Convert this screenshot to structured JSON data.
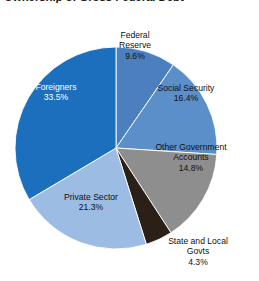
{
  "chart_title": "Ownership of Gross Federal Debt",
  "chart_data": {
    "type": "pie",
    "title": "Ownership of Gross Federal Debt",
    "xlabel": "",
    "ylabel": "",
    "legend_position": "none",
    "grid": false,
    "labels_inside": true,
    "total": 99.9,
    "unit": "%",
    "categories": [
      "Federal Reserve",
      "Social Security",
      "Other Government Accounts",
      "State and Local Govts",
      "Private Sector",
      "Foreigners"
    ],
    "values": [
      9.6,
      16.4,
      14.8,
      4.3,
      21.3,
      33.5
    ],
    "colors": [
      "#4C7FBE",
      "#5B8FC9",
      "#8E8E8E",
      "#2B2018",
      "#9DBCE3",
      "#1B6FBC"
    ],
    "slices": [
      {
        "name": "Federal Reserve",
        "value": 9.6,
        "value_label": "9.6%",
        "color": "#4C7FBE",
        "label_lines": [
          "Federal",
          "Reserve"
        ],
        "start_angle": 0,
        "end_angle": 34.56,
        "text_color": "#111111"
      },
      {
        "name": "Social Security",
        "value": 16.4,
        "value_label": "16.4%",
        "color": "#5B8FC9",
        "label_lines": [
          "Social Security"
        ],
        "start_angle": 34.56,
        "end_angle": 93.6,
        "text_color": "#111111"
      },
      {
        "name": "Other Government Accounts",
        "value": 14.8,
        "value_label": "14.8%",
        "color": "#8E8E8E",
        "label_lines": [
          "Other Government",
          "Accounts"
        ],
        "start_angle": 93.6,
        "end_angle": 146.88,
        "text_color": "#111111"
      },
      {
        "name": "State and Local Govts",
        "value": 4.3,
        "value_label": "4.3%",
        "color": "#2B2018",
        "label_lines": [
          "State and Local",
          "Govts"
        ],
        "start_angle": 146.88,
        "end_angle": 162.36,
        "text_color": "#111111"
      },
      {
        "name": "Private Sector",
        "value": 21.3,
        "value_label": "21.3%",
        "color": "#9DBCE3",
        "label_lines": [
          "Private Sector"
        ],
        "start_angle": 162.36,
        "end_angle": 239.04,
        "text_color": "#111111"
      },
      {
        "name": "Foreigners",
        "value": 33.5,
        "value_label": "33.5%",
        "color": "#1B6FBC",
        "label_lines": [
          "Foreigners"
        ],
        "start_angle": 239.04,
        "end_angle": 360,
        "text_color": "#ffffff"
      }
    ]
  },
  "labels": {
    "federal_reserve": {
      "line1": "Federal",
      "line2": "Reserve",
      "value": "9.6%"
    },
    "social_security": {
      "line1": "Social Security",
      "line2": "",
      "value": "16.4%"
    },
    "other_government_accounts": {
      "line1": "Other Government",
      "line2": "Accounts",
      "value": "14.8%"
    },
    "state_and_local_govts": {
      "line1": "State and Local",
      "line2": "Govts",
      "value": "4.3%"
    },
    "private_sector": {
      "line1": "Private Sector",
      "line2": "",
      "value": "21.3%"
    },
    "foreigners": {
      "line1": "Foreigners",
      "line2": "",
      "value": "33.5%"
    }
  }
}
